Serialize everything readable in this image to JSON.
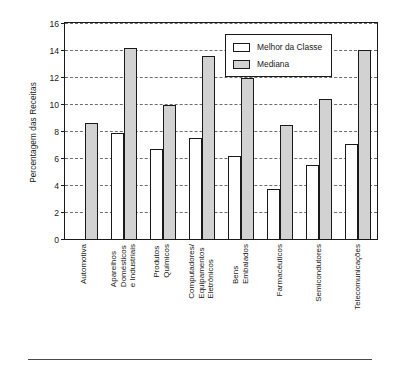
{
  "chart_data": {
    "type": "bar",
    "title": "",
    "subtitle": "",
    "xlabel": "",
    "ylabel": "Percentagem das Receitas",
    "ylim": [
      0,
      16
    ],
    "ytick_values": [
      0,
      2,
      4,
      6,
      8,
      10,
      12,
      14,
      16
    ],
    "ytick_labels": [
      "0",
      "2",
      "4",
      "6",
      "8",
      "10",
      "12",
      "14",
      "16"
    ],
    "grid": true,
    "grid_style": "dashed-horizontal",
    "legend_position": "top-right-inside",
    "categories": [
      "Automotiva",
      "Aparelhos Domésticos e Industriais",
      "Produtos Químicos",
      "Computadores/ Equipamentos Eletrônicos",
      "Bens Embalados",
      "Farmacêuticos",
      "Semicondutores",
      "Telecomunicações"
    ],
    "category_lines": [
      [
        "Automotiva"
      ],
      [
        "Aparelhos",
        "Domésticos",
        "e Industriais"
      ],
      [
        "Produtos",
        "Químicos"
      ],
      [
        "Computadores/",
        "Equipamentos",
        "Eletrônicos"
      ],
      [
        "Bens",
        "Embalados"
      ],
      [
        "Farmacêuticos"
      ],
      [
        "Semicondutores"
      ],
      [
        "Telecomunicações"
      ]
    ],
    "series": [
      {
        "name": "Melhor da Classe",
        "color": "#ffffff",
        "edge_color": "#1a1a1a",
        "values": [
          null,
          7.8,
          6.6,
          7.4,
          6.1,
          3.65,
          5.45,
          7.0
        ]
      },
      {
        "name": "Mediana",
        "color": "#d2d2d2",
        "edge_color": "#1a1a1a",
        "values": [
          8.55,
          14.05,
          9.85,
          13.4,
          11.85,
          8.4,
          10.25,
          13.85
        ]
      }
    ]
  },
  "legend": {
    "items": [
      {
        "label": "Melhor da Classe",
        "swatch": "best"
      },
      {
        "label": "Mediana",
        "swatch": "median"
      }
    ]
  }
}
